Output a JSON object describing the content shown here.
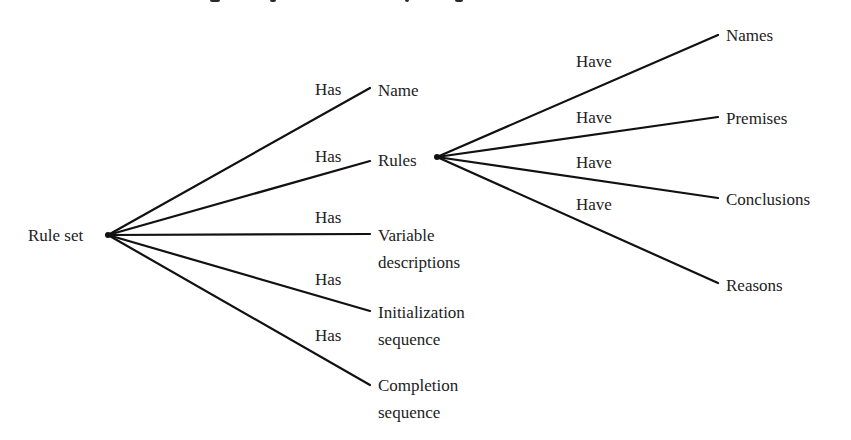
{
  "diagram": {
    "type": "tree",
    "root": {
      "label": "Rule set",
      "x": 28,
      "y": 222,
      "hub": [
        108,
        235
      ]
    },
    "level1": {
      "edge_label": "Has",
      "nodes": [
        {
          "id": "name",
          "lines": [
            "Name"
          ],
          "x": 378,
          "y": 77,
          "end": [
            370,
            88
          ],
          "edge_label_pos": [
            315,
            80
          ]
        },
        {
          "id": "rules",
          "lines": [
            "Rules"
          ],
          "x": 378,
          "y": 147,
          "end": [
            370,
            160
          ],
          "edge_label_pos": [
            315,
            147
          ]
        },
        {
          "id": "variable-descriptions",
          "lines": [
            "Variable",
            "descriptions"
          ],
          "x": 378,
          "y": 222,
          "end": [
            370,
            234
          ],
          "edge_label_pos": [
            315,
            208
          ]
        },
        {
          "id": "initialization-sequence",
          "lines": [
            "Initialization",
            "sequence"
          ],
          "x": 378,
          "y": 299,
          "end": [
            370,
            311
          ],
          "edge_label_pos": [
            315,
            270
          ]
        },
        {
          "id": "completion-sequence",
          "lines": [
            "Completion",
            "sequence"
          ],
          "x": 378,
          "y": 372,
          "end": [
            370,
            385
          ],
          "edge_label_pos": [
            315,
            326
          ]
        }
      ]
    },
    "level2": {
      "parent": "rules",
      "hub": [
        437,
        157
      ],
      "edge_label": "Have",
      "nodes": [
        {
          "id": "names",
          "label": "Names",
          "x": 726,
          "y": 22,
          "end": [
            718,
            35
          ],
          "edge_label_pos": [
            576,
            52
          ]
        },
        {
          "id": "premises",
          "label": "Premises",
          "x": 726,
          "y": 105,
          "end": [
            718,
            117
          ],
          "edge_label_pos": [
            576,
            108
          ]
        },
        {
          "id": "conclusions",
          "label": "Conclusions",
          "x": 726,
          "y": 186,
          "end": [
            718,
            198
          ],
          "edge_label_pos": [
            576,
            153
          ]
        },
        {
          "id": "reasons",
          "label": "Reasons",
          "x": 726,
          "y": 272,
          "end": [
            718,
            283
          ],
          "edge_label_pos": [
            576,
            195
          ]
        }
      ]
    },
    "labels": {
      "root": "Rule set",
      "name": "Name",
      "rules": "Rules",
      "variable_1": "Variable",
      "variable_2": "descriptions",
      "init_1": "Initialization",
      "init_2": "sequence",
      "completion_1": "Completion",
      "completion_2": "sequence",
      "names": "Names",
      "premises": "Premises",
      "conclusions": "Conclusions",
      "reasons": "Reasons",
      "has": "Has",
      "have": "Have"
    },
    "colors": {
      "line": "#111111",
      "text": "#222222",
      "background": "#ffffff"
    }
  }
}
